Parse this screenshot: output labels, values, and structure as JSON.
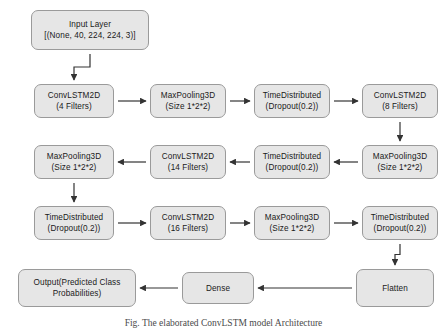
{
  "figure": {
    "type": "flowchart",
    "orientation": "serpentine-boustrophedon",
    "caption": "Fig. The elaborated ConvLSTM model Architecture",
    "colors": {
      "node_fill": "#e6e6e6",
      "node_border": "#9a9a9a",
      "arrow": "#333333",
      "text": "#1a1a1a",
      "background": "#ffffff"
    }
  },
  "nodes": [
    {
      "id": "input",
      "line1": "Input Layer",
      "line2": "[(None, 40, 224, 224, 3)]",
      "x": 31,
      "y": 10,
      "w": 118,
      "h": 40
    },
    {
      "id": "conv1",
      "line1": "ConvLSTM2D",
      "line2": "(4 Filters)",
      "x": 34,
      "y": 84,
      "w": 80,
      "h": 34
    },
    {
      "id": "pool1",
      "line1": "MaxPooling3D",
      "line2": "(Size 1*2*2)",
      "x": 150,
      "y": 84,
      "w": 76,
      "h": 34
    },
    {
      "id": "drop1",
      "line1": "TimeDistributed",
      "line2": "(Dropout(0.2))",
      "x": 254,
      "y": 84,
      "w": 76,
      "h": 34
    },
    {
      "id": "conv2",
      "line1": "ConvLSTM2D",
      "line2": "(8 Filters)",
      "x": 362,
      "y": 84,
      "w": 76,
      "h": 34
    },
    {
      "id": "pool2",
      "line1": "MaxPooling3D",
      "line2": "(Size 1*2*2)",
      "x": 34,
      "y": 145,
      "w": 80,
      "h": 34
    },
    {
      "id": "conv3",
      "line1": "ConvLSTM2D",
      "line2": "(14 Filters)",
      "x": 150,
      "y": 145,
      "w": 76,
      "h": 34
    },
    {
      "id": "drop2",
      "line1": "TimeDistributed",
      "line2": "(Dropout(0.2))",
      "x": 254,
      "y": 145,
      "w": 76,
      "h": 34
    },
    {
      "id": "pool3",
      "line1": "MaxPooling3D",
      "line2": "(Size 1*2*2)",
      "x": 362,
      "y": 145,
      "w": 76,
      "h": 34
    },
    {
      "id": "drop3",
      "line1": "TimeDistributed",
      "line2": "(Dropout(0.2))",
      "x": 34,
      "y": 206,
      "w": 80,
      "h": 34
    },
    {
      "id": "conv4",
      "line1": "ConvLSTM2D",
      "line2": "(16 Filters)",
      "x": 150,
      "y": 206,
      "w": 76,
      "h": 34
    },
    {
      "id": "pool4",
      "line1": "MaxPooling3D",
      "line2": "(Size 1*2*2)",
      "x": 254,
      "y": 206,
      "w": 76,
      "h": 34
    },
    {
      "id": "drop4",
      "line1": "TimeDistributed",
      "line2": "(Dropout(0.2))",
      "x": 362,
      "y": 206,
      "w": 76,
      "h": 34
    },
    {
      "id": "output",
      "line1": "Output(Predicted Class",
      "line2": "Probabilities)",
      "x": 18,
      "y": 269,
      "w": 118,
      "h": 38
    },
    {
      "id": "dense",
      "line1": "Dense",
      "line2": "",
      "x": 182,
      "y": 272,
      "w": 72,
      "h": 32
    },
    {
      "id": "flatten",
      "line1": "Flatten",
      "line2": "",
      "x": 356,
      "y": 269,
      "w": 78,
      "h": 38
    }
  ],
  "edges": [
    {
      "from": "input",
      "to": "conv1",
      "direction": "down"
    },
    {
      "from": "conv1",
      "to": "pool1",
      "direction": "right"
    },
    {
      "from": "pool1",
      "to": "drop1",
      "direction": "right"
    },
    {
      "from": "drop1",
      "to": "conv2",
      "direction": "right"
    },
    {
      "from": "conv2",
      "to": "pool3",
      "direction": "down"
    },
    {
      "from": "pool3",
      "to": "drop2",
      "direction": "left"
    },
    {
      "from": "drop2",
      "to": "conv3",
      "direction": "left"
    },
    {
      "from": "conv3",
      "to": "pool2",
      "direction": "left"
    },
    {
      "from": "pool2",
      "to": "drop3",
      "direction": "down"
    },
    {
      "from": "drop3",
      "to": "conv4",
      "direction": "right"
    },
    {
      "from": "conv4",
      "to": "pool4",
      "direction": "right"
    },
    {
      "from": "pool4",
      "to": "drop4",
      "direction": "right"
    },
    {
      "from": "drop4",
      "to": "flatten",
      "direction": "down"
    },
    {
      "from": "flatten",
      "to": "dense",
      "direction": "left"
    },
    {
      "from": "dense",
      "to": "output",
      "direction": "left"
    }
  ]
}
